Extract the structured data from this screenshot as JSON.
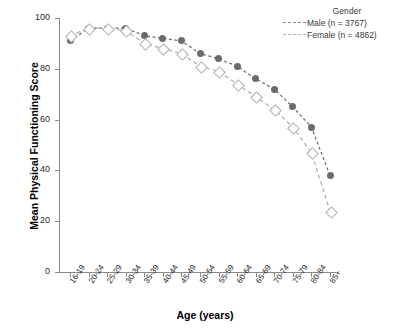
{
  "chart_data": {
    "type": "line",
    "title": "",
    "xlabel": "Age (years)",
    "ylabel": "Mean Physical Functioning Score",
    "ylim": [
      0,
      100
    ],
    "yticks": [
      0,
      20,
      40,
      60,
      80,
      100
    ],
    "grid": false,
    "legend_position": "top-right",
    "legend_title": "Gender",
    "categories": [
      "16-19",
      "20-24",
      "25-29",
      "30-34",
      "35-39",
      "40-44",
      "45-49",
      "50-54",
      "55-59",
      "60-64",
      "65-69",
      "70-74",
      "75-79",
      "80-84",
      "85+"
    ],
    "series": [
      {
        "name": "Male (n = 3767)",
        "color": "#6b6b6b",
        "marker": "filled-circle",
        "linestyle": "dashed",
        "values": [
          91,
          96,
          96,
          96,
          93,
          92,
          91,
          86,
          84,
          81,
          76,
          72,
          65,
          57,
          38
        ]
      },
      {
        "name": "Female (n = 4862)",
        "color": "#adadad",
        "marker": "open-diamond",
        "linestyle": "dashed",
        "values": [
          93,
          96,
          96,
          95,
          90,
          88,
          86,
          81,
          79,
          74,
          69,
          64,
          57,
          47,
          24
        ]
      }
    ]
  },
  "legend": {
    "title": "Gender",
    "entries": [
      {
        "label": "Male (n = 3767)"
      },
      {
        "label": "Female (n = 4862)"
      }
    ]
  },
  "axes": {
    "y_title": "Mean Physical Functioning Score",
    "x_title": "Age (years)",
    "y_ticks": [
      "0",
      "20",
      "40",
      "60",
      "80",
      "100"
    ],
    "x_ticks": [
      "16-19",
      "20-24",
      "25-29",
      "30-34",
      "35-39",
      "40-44",
      "45-49",
      "50-54",
      "55-59",
      "60-64",
      "65-69",
      "70-74",
      "75-79",
      "80-84",
      "85+"
    ]
  },
  "colors": {
    "male": "#6b6b6b",
    "female": "#adadad",
    "axis": "#8a8a8a",
    "text": "#1d1d1d"
  }
}
